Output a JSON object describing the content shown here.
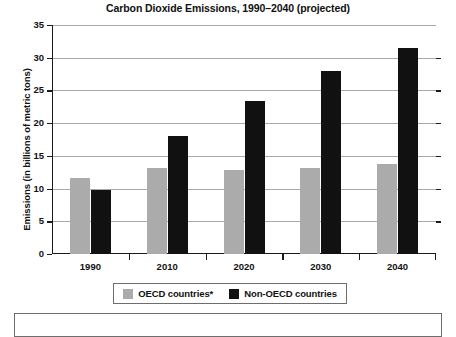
{
  "chart_data": {
    "type": "bar",
    "title": "Carbon Dioxide Emissions, 1990–2040 (projected)",
    "xlabel": "",
    "ylabel": "Emissions (in billions of metric tons)",
    "categories": [
      "1990",
      "2010",
      "2020",
      "2030",
      "2040"
    ],
    "series": [
      {
        "name": "OECD countries*",
        "color": "#ababab",
        "values": [
          11.5,
          13.0,
          12.8,
          13.1,
          13.7
        ]
      },
      {
        "name": "Non-OECD countries",
        "color": "#111111",
        "values": [
          9.7,
          18.0,
          23.3,
          27.9,
          31.4
        ]
      }
    ],
    "ylim": [
      0,
      35
    ],
    "ytick_labels": [
      "0",
      "5",
      "10",
      "15",
      "20",
      "25",
      "30",
      "35"
    ],
    "ytick_values": [
      0,
      5,
      10,
      15,
      20,
      25,
      30,
      35
    ],
    "grid": true,
    "legend_position": "bottom"
  },
  "legend": {
    "items": [
      {
        "label": "OECD countries*",
        "color": "#ababab"
      },
      {
        "label": "Non-OECD countries",
        "color": "#111111"
      }
    ]
  },
  "footnote": {
    "text": ""
  }
}
